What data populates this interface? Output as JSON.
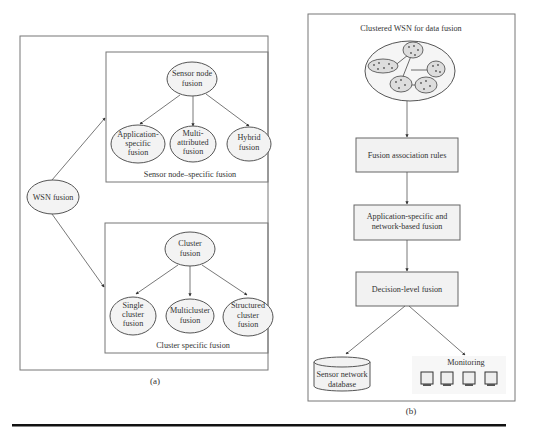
{
  "panel_a": {
    "caption": "(a)",
    "root": {
      "label": "WSN fusion"
    },
    "sensor_group": {
      "title": "Sensor node–specific fusion",
      "parent": [
        "Sensor node",
        "fusion"
      ],
      "children": [
        [
          "Application-",
          "specific",
          "fusion"
        ],
        [
          "Multi-",
          "attributed",
          "fusion"
        ],
        [
          "Hybrid",
          "fusion"
        ]
      ]
    },
    "cluster_group": {
      "title": "Cluster specific fusion",
      "parent": [
        "Cluster",
        "fusion"
      ],
      "children": [
        [
          "Single",
          "cluster",
          "fusion"
        ],
        [
          "Multicluster",
          "fusion"
        ],
        [
          "Structured",
          "cluster",
          "fusion"
        ]
      ]
    }
  },
  "panel_b": {
    "caption": "(b)",
    "title": "Clustered WSN for data fusion",
    "steps": [
      [
        "Fusion association rules"
      ],
      [
        "Application-specific and",
        "network-based fusion"
      ],
      [
        "Decision-level fusion"
      ]
    ],
    "outputs": {
      "database": [
        "Sensor network",
        "database"
      ],
      "monitoring": {
        "label": "Monitoring",
        "monitor_count": 4
      }
    }
  },
  "colors": {
    "line": "#555555",
    "box_fill": "#f2f2f2",
    "rule": "#111111"
  }
}
